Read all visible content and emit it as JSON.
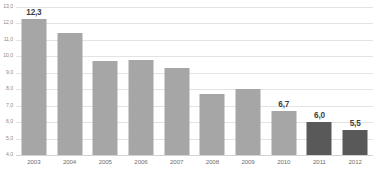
{
  "chart_data": {
    "type": "bar",
    "title": "",
    "subtitle": "",
    "xlabel": "",
    "ylabel": "",
    "categories": [
      "2003",
      "2004",
      "2005",
      "2006",
      "2007",
      "2008",
      "2009",
      "2010",
      "2011",
      "2012"
    ],
    "values": [
      12.3,
      11.4,
      9.7,
      9.8,
      9.3,
      7.7,
      8.0,
      6.7,
      6.0,
      5.5
    ],
    "value_labels": [
      "12,3",
      "",
      "",
      "",
      "",
      "",
      "",
      "6,7",
      "6,0",
      "5,5"
    ],
    "bar_colors": [
      "#a6a6a6",
      "#a6a6a6",
      "#a6a6a6",
      "#a6a6a6",
      "#a6a6a6",
      "#a6a6a6",
      "#a6a6a6",
      "#a6a6a6",
      "#595959",
      "#595959"
    ],
    "ylim": [
      4.0,
      13.0
    ],
    "ytick_values": [
      13.0,
      12.0,
      11.0,
      10.0,
      9.0,
      8.0,
      7.0,
      6.0,
      5.0,
      4.0
    ],
    "ytick_labels": [
      "13,0",
      "12,0",
      "11,0",
      "10,0",
      "9,0",
      "8,0",
      "7,0",
      "6,0",
      "5,0",
      "4,0"
    ],
    "grid": true,
    "grid_axis": "y",
    "legend": false,
    "legend_position": "none",
    "decimal_separator": ",",
    "colors": {
      "bar_light": "#a6a6a6",
      "bar_dark": "#595959",
      "gridline": "#e3e3e3",
      "baseline": "#d2d2d2",
      "tick_text": "#8c8c8c",
      "xlabel_text": "#6e6e6e",
      "value_text": "#3d3d3d",
      "background": "#ffffff"
    }
  }
}
